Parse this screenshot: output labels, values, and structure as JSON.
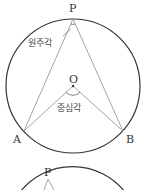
{
  "figure1": {
    "labels": {
      "P": "P",
      "O": "O",
      "A": "A",
      "B": "B"
    },
    "inscribed_angle_label": "원주각",
    "central_angle_label": "중심각"
  },
  "figure2": {
    "labels": {
      "P": "P"
    }
  },
  "colors": {
    "circle": "#333333",
    "line": "#999999",
    "text": "#333333"
  }
}
